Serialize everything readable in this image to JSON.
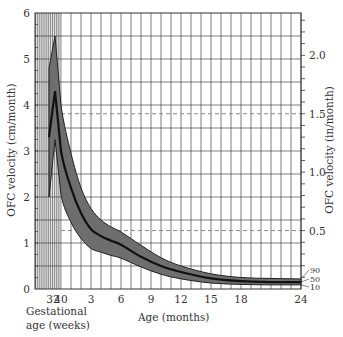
{
  "chart_data": {
    "type": "area",
    "title": "",
    "ylabel_left": "OFC velocity (cm/month)",
    "ylabel_right": "OFC velocity (in/month)",
    "xlabel_gestational": [
      "Gestational",
      "age (weeks)"
    ],
    "xlabel": "Age (months)",
    "x_ticks": [
      {
        "label": "32",
        "x_month": -0.8
      },
      {
        "label": "40",
        "x_month": 0
      },
      {
        "label": "3",
        "x_month": 3
      },
      {
        "label": "6",
        "x_month": 6
      },
      {
        "label": "9",
        "x_month": 9
      },
      {
        "label": "12",
        "x_month": 12
      },
      {
        "label": "15",
        "x_month": 15
      },
      {
        "label": "18",
        "x_month": 18
      },
      {
        "label": "24",
        "x_month": 24
      }
    ],
    "ylim_left": [
      0,
      6
    ],
    "y_ticks_left": [
      "0",
      "1",
      "2",
      "3",
      "4",
      "5",
      "6"
    ],
    "y_ticks_right": [
      "0.5",
      "1.0",
      "1.5",
      "2.0"
    ],
    "dashed_reference_lines_in": [
      0.5,
      1.5
    ],
    "grid": true,
    "percentile_labels": [
      "90",
      "50",
      "10"
    ],
    "x": [
      -1.2,
      -0.6,
      0,
      1,
      2,
      3,
      4,
      5,
      6,
      8,
      10,
      12,
      15,
      18,
      21,
      24
    ],
    "x_note": "x in months relative to 40 weeks gestation; negative = preterm (32 wk ≈ -0.8)",
    "series": [
      {
        "name": "90th percentile",
        "values": [
          4.8,
          5.5,
          4.0,
          2.95,
          2.2,
          1.75,
          1.5,
          1.35,
          1.24,
          0.95,
          0.68,
          0.5,
          0.33,
          0.25,
          0.23,
          0.22
        ]
      },
      {
        "name": "50th percentile",
        "values": [
          3.3,
          4.3,
          3.0,
          2.2,
          1.65,
          1.3,
          1.15,
          1.05,
          0.96,
          0.7,
          0.5,
          0.37,
          0.23,
          0.17,
          0.15,
          0.15
        ]
      },
      {
        "name": "10th percentile",
        "values": [
          2.0,
          3.25,
          2.05,
          1.45,
          1.1,
          0.88,
          0.8,
          0.73,
          0.67,
          0.48,
          0.32,
          0.22,
          0.13,
          0.1,
          0.09,
          0.09
        ]
      }
    ],
    "colors": {
      "band": "#6e6e6e",
      "median": "#111111",
      "grid": "#444444",
      "gestational_shade": "#e6e6e6",
      "dashed": "#888888"
    }
  }
}
